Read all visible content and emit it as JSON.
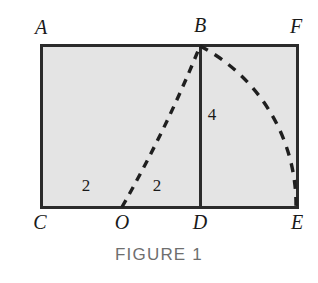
{
  "figure": {
    "caption": "FIGURE 1",
    "colors": {
      "fill": "#e4e4e4",
      "stroke": "#2b2b2b",
      "dash": "#1f1f1f",
      "caption": "#6e6e6e",
      "background": "#ffffff"
    },
    "vertex_labels": [
      {
        "name": "A",
        "text": "A",
        "x": 41,
        "y": 26
      },
      {
        "name": "B",
        "text": "B",
        "x": 200,
        "y": 24
      },
      {
        "name": "F",
        "text": "F",
        "x": 296,
        "y": 25
      },
      {
        "name": "C",
        "text": "C",
        "x": 40,
        "y": 222
      },
      {
        "name": "O",
        "text": "O",
        "x": 122,
        "y": 222
      },
      {
        "name": "D",
        "text": "D",
        "x": 200,
        "y": 222
      },
      {
        "name": "E",
        "text": "E",
        "x": 297,
        "y": 222
      }
    ],
    "measure_labels": [
      {
        "name": "segment-co-length",
        "text": "2",
        "x": 86,
        "y": 184
      },
      {
        "name": "segment-od-length",
        "text": "2",
        "x": 157,
        "y": 184
      },
      {
        "name": "segment-bd-length",
        "text": "4",
        "x": 211,
        "y": 113
      }
    ],
    "geometry": {
      "rectangle": {
        "left": 41,
        "top": 45,
        "right": 297,
        "bottom": 207
      },
      "vertical_segment_bd": {
        "x": 200,
        "y1": 45,
        "y2": 207
      },
      "dashed_line_ob": {
        "x1": 122,
        "y1": 207,
        "x2": 200,
        "y2": 45
      },
      "dashed_arc_be": {
        "x1": 200,
        "y1": 45,
        "x2": 297,
        "y2": 207,
        "center_x": 122,
        "center_y": 207
      }
    }
  }
}
